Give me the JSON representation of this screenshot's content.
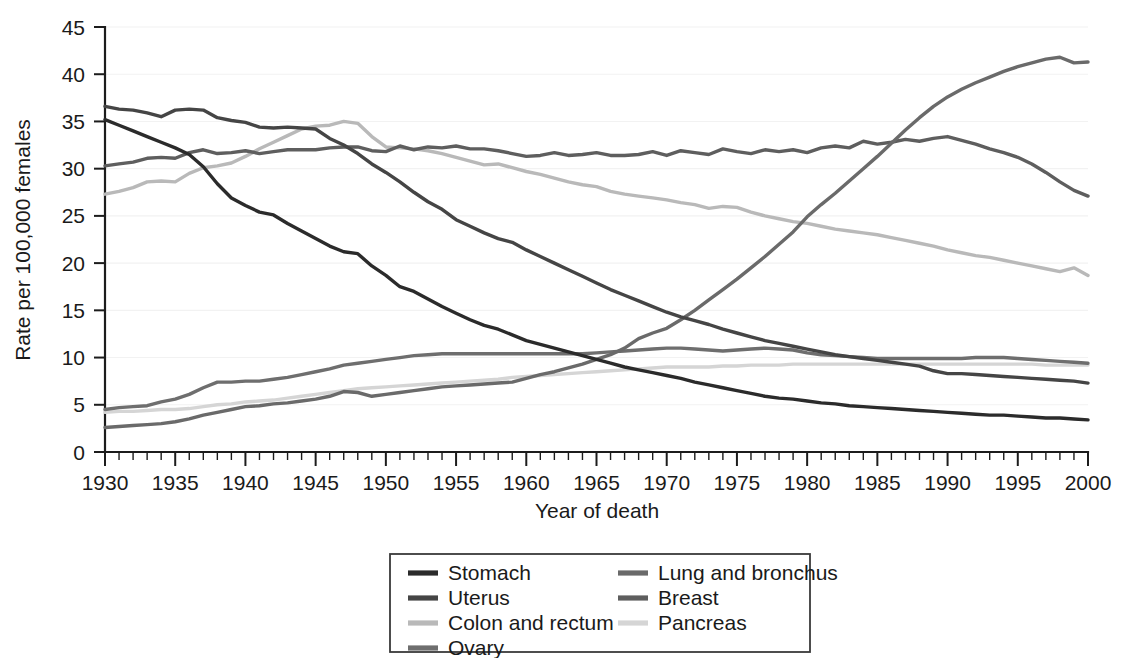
{
  "chart_data": {
    "type": "line",
    "title": "",
    "xlabel": "Year of death",
    "ylabel": "Rate per 100,000 females",
    "xlim": [
      1930,
      2000
    ],
    "ylim": [
      0,
      45
    ],
    "xticks": [
      1930,
      1935,
      1940,
      1945,
      1950,
      1955,
      1960,
      1965,
      1970,
      1975,
      1980,
      1985,
      1990,
      1995,
      2000
    ],
    "yticks": [
      0,
      5,
      10,
      15,
      20,
      25,
      30,
      35,
      40,
      45
    ],
    "x_minor_tick_step": 1,
    "grid": true,
    "grid_axis": "y",
    "legend_position": "bottom-center",
    "legend_columns": 2,
    "x": [
      1930,
      1931,
      1932,
      1933,
      1934,
      1935,
      1936,
      1937,
      1938,
      1939,
      1940,
      1941,
      1942,
      1943,
      1944,
      1945,
      1946,
      1947,
      1948,
      1949,
      1950,
      1951,
      1952,
      1953,
      1954,
      1955,
      1956,
      1957,
      1958,
      1959,
      1960,
      1961,
      1962,
      1963,
      1964,
      1965,
      1966,
      1967,
      1968,
      1969,
      1970,
      1971,
      1972,
      1973,
      1974,
      1975,
      1976,
      1977,
      1978,
      1979,
      1980,
      1981,
      1982,
      1983,
      1984,
      1985,
      1986,
      1987,
      1988,
      1989,
      1990,
      1991,
      1992,
      1993,
      1994,
      1995,
      1996,
      1997,
      1998,
      1999,
      2000
    ],
    "series": [
      {
        "name": "Stomach",
        "color": "#2b2b2b",
        "values": [
          35.2,
          34.6,
          34.0,
          33.4,
          32.8,
          32.2,
          31.5,
          30.2,
          28.4,
          26.9,
          26.1,
          25.4,
          25.1,
          24.2,
          23.4,
          22.6,
          21.8,
          21.2,
          21.0,
          19.7,
          18.7,
          17.5,
          17.0,
          16.2,
          15.4,
          14.7,
          14.0,
          13.4,
          13.0,
          12.4,
          11.8,
          11.4,
          11.0,
          10.6,
          10.2,
          9.8,
          9.4,
          9.0,
          8.7,
          8.4,
          8.1,
          7.8,
          7.4,
          7.1,
          6.8,
          6.5,
          6.2,
          5.9,
          5.7,
          5.6,
          5.4,
          5.2,
          5.1,
          4.9,
          4.8,
          4.7,
          4.6,
          4.5,
          4.4,
          4.3,
          4.2,
          4.1,
          4.0,
          3.9,
          3.9,
          3.8,
          3.7,
          3.6,
          3.6,
          3.5,
          3.4
        ]
      },
      {
        "name": "Uterus",
        "color": "#454545",
        "values": [
          36.6,
          36.3,
          36.2,
          35.9,
          35.5,
          36.2,
          36.3,
          36.2,
          35.4,
          35.1,
          34.9,
          34.4,
          34.3,
          34.4,
          34.3,
          34.2,
          33.2,
          32.5,
          31.6,
          30.5,
          29.6,
          28.6,
          27.5,
          26.5,
          25.7,
          24.6,
          23.9,
          23.2,
          22.6,
          22.2,
          21.4,
          20.7,
          20.0,
          19.3,
          18.6,
          17.9,
          17.2,
          16.6,
          16.0,
          15.4,
          14.8,
          14.3,
          13.9,
          13.5,
          13.0,
          12.6,
          12.2,
          11.8,
          11.5,
          11.2,
          10.9,
          10.6,
          10.3,
          10.1,
          9.9,
          9.7,
          9.5,
          9.3,
          9.1,
          8.6,
          8.3,
          8.3,
          8.2,
          8.1,
          8.0,
          7.9,
          7.8,
          7.7,
          7.6,
          7.5,
          7.3
        ]
      },
      {
        "name": "Colon and rectum",
        "color": "#b9b9b9",
        "values": [
          27.3,
          27.6,
          28.0,
          28.6,
          28.7,
          28.6,
          29.5,
          30.1,
          30.3,
          30.6,
          31.3,
          32.1,
          32.8,
          33.5,
          34.2,
          34.5,
          34.6,
          35.0,
          34.8,
          33.4,
          32.3,
          32.2,
          32.1,
          31.9,
          31.6,
          31.2,
          30.8,
          30.4,
          30.5,
          30.1,
          29.7,
          29.4,
          29.0,
          28.6,
          28.3,
          28.1,
          27.6,
          27.3,
          27.1,
          26.9,
          26.7,
          26.4,
          26.2,
          25.8,
          26.0,
          25.9,
          25.4,
          25.0,
          24.7,
          24.4,
          24.2,
          23.9,
          23.6,
          23.4,
          23.2,
          23.0,
          22.7,
          22.4,
          22.1,
          21.8,
          21.4,
          21.1,
          20.8,
          20.6,
          20.3,
          20.0,
          19.7,
          19.4,
          19.1,
          19.5,
          18.7
        ]
      },
      {
        "name": "Ovary",
        "color": "#6e6e6e",
        "values": [
          4.5,
          4.7,
          4.8,
          4.9,
          5.3,
          5.6,
          6.1,
          6.8,
          7.4,
          7.4,
          7.5,
          7.5,
          7.7,
          7.9,
          8.2,
          8.5,
          8.8,
          9.2,
          9.4,
          9.6,
          9.8,
          10.0,
          10.2,
          10.3,
          10.4,
          10.4,
          10.4,
          10.4,
          10.4,
          10.4,
          10.4,
          10.4,
          10.4,
          10.4,
          10.4,
          10.5,
          10.6,
          10.7,
          10.8,
          10.9,
          11.0,
          11.0,
          10.9,
          10.8,
          10.7,
          10.8,
          10.9,
          11.0,
          10.9,
          10.8,
          10.5,
          10.3,
          10.2,
          10.1,
          10.0,
          9.9,
          9.9,
          9.9,
          9.9,
          9.9,
          9.9,
          9.9,
          10.0,
          10.0,
          10.0,
          9.9,
          9.8,
          9.7,
          9.6,
          9.5,
          9.4
        ]
      },
      {
        "name": "Lung and bronchus",
        "color": "#6a6a6a",
        "values": [
          2.6,
          2.7,
          2.8,
          2.9,
          3.0,
          3.2,
          3.5,
          3.9,
          4.2,
          4.5,
          4.8,
          4.9,
          5.1,
          5.2,
          5.4,
          5.6,
          5.9,
          6.4,
          6.3,
          5.9,
          6.1,
          6.3,
          6.5,
          6.7,
          6.9,
          7.0,
          7.1,
          7.2,
          7.3,
          7.4,
          7.8,
          8.2,
          8.5,
          8.9,
          9.3,
          9.8,
          10.3,
          11.0,
          12.0,
          12.6,
          13.1,
          14.0,
          15.0,
          16.1,
          17.2,
          18.3,
          19.5,
          20.7,
          22.0,
          23.3,
          24.9,
          26.2,
          27.4,
          28.7,
          30.0,
          31.3,
          32.7,
          34.1,
          35.4,
          36.6,
          37.6,
          38.4,
          39.1,
          39.7,
          40.3,
          40.8,
          41.2,
          41.6,
          41.8,
          41.2,
          41.3
        ]
      },
      {
        "name": "Breast",
        "color": "#5e5e5e",
        "values": [
          30.3,
          30.5,
          30.7,
          31.1,
          31.2,
          31.1,
          31.7,
          32.0,
          31.6,
          31.7,
          31.9,
          31.6,
          31.8,
          32.0,
          32.0,
          32.0,
          32.2,
          32.3,
          32.3,
          31.9,
          31.8,
          32.4,
          32.0,
          32.3,
          32.2,
          32.4,
          32.1,
          32.1,
          31.9,
          31.6,
          31.3,
          31.4,
          31.7,
          31.4,
          31.5,
          31.7,
          31.4,
          31.4,
          31.5,
          31.8,
          31.4,
          31.9,
          31.7,
          31.5,
          32.1,
          31.8,
          31.6,
          32.0,
          31.8,
          32.0,
          31.7,
          32.2,
          32.4,
          32.2,
          32.9,
          32.6,
          32.8,
          33.1,
          32.9,
          33.2,
          33.4,
          33.0,
          32.6,
          32.1,
          31.7,
          31.2,
          30.5,
          29.6,
          28.6,
          27.7,
          27.1
        ]
      },
      {
        "name": "Pancreas",
        "color": "#d5d5d5",
        "values": [
          4.2,
          4.3,
          4.3,
          4.4,
          4.5,
          4.5,
          4.6,
          4.8,
          5.0,
          5.1,
          5.3,
          5.4,
          5.5,
          5.7,
          5.9,
          6.1,
          6.3,
          6.5,
          6.7,
          6.8,
          6.9,
          7.0,
          7.1,
          7.2,
          7.3,
          7.4,
          7.5,
          7.6,
          7.7,
          7.9,
          8.0,
          8.1,
          8.2,
          8.3,
          8.4,
          8.5,
          8.6,
          8.7,
          8.8,
          8.9,
          9.0,
          9.0,
          9.0,
          9.0,
          9.1,
          9.1,
          9.2,
          9.2,
          9.2,
          9.3,
          9.3,
          9.3,
          9.3,
          9.3,
          9.3,
          9.3,
          9.3,
          9.3,
          9.3,
          9.3,
          9.3,
          9.3,
          9.3,
          9.3,
          9.3,
          9.3,
          9.3,
          9.2,
          9.2,
          9.2,
          9.2
        ]
      }
    ]
  },
  "legend": {
    "entries": [
      {
        "label": "Stomach",
        "color": "#2b2b2b",
        "column": 0,
        "row": 0
      },
      {
        "label": "Uterus",
        "color": "#454545",
        "column": 0,
        "row": 1
      },
      {
        "label": "Colon and rectum",
        "color": "#b9b9b9",
        "column": 0,
        "row": 2
      },
      {
        "label": "Ovary",
        "color": "#6e6e6e",
        "column": 0,
        "row": 3
      },
      {
        "label": "Lung and bronchus",
        "color": "#6a6a6a",
        "column": 1,
        "row": 0
      },
      {
        "label": "Breast",
        "color": "#5e5e5e",
        "column": 1,
        "row": 1
      },
      {
        "label": "Pancreas",
        "color": "#d5d5d5",
        "column": 1,
        "row": 2
      }
    ]
  }
}
